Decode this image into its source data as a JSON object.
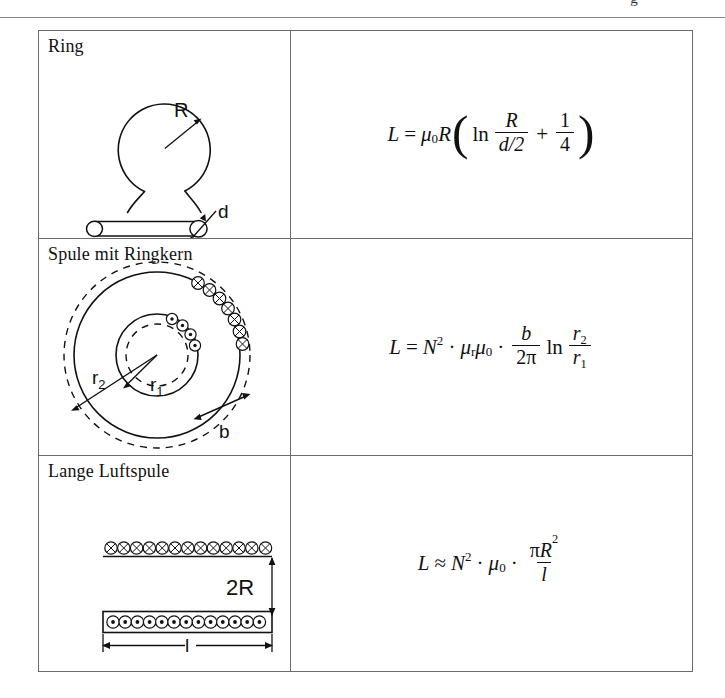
{
  "page": {
    "header_rule_visible": true,
    "header_glyph": "g",
    "background_color": "#ffffff",
    "ink_color": "#111111",
    "border_color": "#6b6b6b"
  },
  "table": {
    "columns": [
      "Anordnung",
      "Induktivität"
    ],
    "rows": [
      {
        "title": "Ring",
        "diagram": {
          "name": "ring-loop-diagram",
          "labels": [
            "R",
            "d"
          ],
          "description": "Kreisförmige Drahtschleife mit Radius R und Zuleitungen; unten Drahtquerschnitt mit Durchmesser d"
        },
        "formula": {
          "plain": "L = μ0 R ( ln R/(d/2) + 1/4 )",
          "lhs": "L",
          "relation": "=",
          "terms": {
            "mu": "μ",
            "mu_sub": "0",
            "R": "R",
            "ln": "ln",
            "num1": "R",
            "den1": "d/2",
            "num2": "1",
            "den2": "4",
            "plus": "+"
          }
        }
      },
      {
        "title": "Spule mit Ringkern",
        "diagram": {
          "name": "toroid-core-coil-diagram",
          "labels": [
            "r2",
            "r1",
            "b"
          ],
          "label_r2": "r",
          "label_r2_sub": "2",
          "label_r1": "r",
          "label_r1_sub": "1",
          "label_b": "b",
          "description": "Ringkern mit Innenradius r1 und Außenradius r2, Wicklung N, Höhe b"
        },
        "formula": {
          "plain": "L = N^2 · μr μ0 · b/(2π) ln (r2/r1)",
          "lhs": "L",
          "relation": "=",
          "terms": {
            "N": "N",
            "N_exp": "2",
            "dot": "·",
            "mu": "μ",
            "mu_sub_r": "r",
            "mu_sub_0": "0",
            "num1": "b",
            "den1": "2π",
            "ln": "ln",
            "num2": "r",
            "num2_sub": "2",
            "den2": "r",
            "den2_sub": "1"
          }
        }
      },
      {
        "title": "Lange Luftspule",
        "diagram": {
          "name": "long-air-coil-diagram",
          "labels": [
            "2R",
            "l"
          ],
          "label_2R": "2R",
          "label_l": "l",
          "turns_top": 13,
          "turns_bottom": 14,
          "description": "Lange Luftspule im Längsschnitt, Durchmesser 2R, Länge l"
        },
        "formula": {
          "plain": "L ≈ N^2 · μ0 · πR^2 / l",
          "lhs": "L",
          "relation": "≈",
          "terms": {
            "N": "N",
            "N_exp": "2",
            "dot": "·",
            "mu": "μ",
            "mu_sub": "0",
            "pi": "π",
            "R": "R",
            "R_exp": "2",
            "den": "l"
          }
        }
      }
    ]
  }
}
